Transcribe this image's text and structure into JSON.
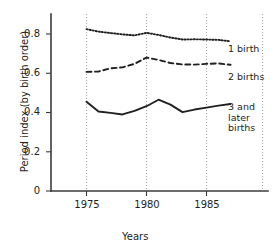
{
  "chart_data": {
    "type": "line",
    "title": "",
    "xlabel": "Years",
    "ylabel": "Period index (by birth order)",
    "xlim": [
      1973,
      1988
    ],
    "ylim": [
      0,
      0.9
    ],
    "xticks": [
      1975,
      1980,
      1985
    ],
    "xtick_labels": [
      "1975",
      "1980",
      "1985"
    ],
    "yticks": [
      0,
      0.2,
      0.4,
      0.6,
      0.8
    ],
    "ytick_labels": [
      "0",
      "0.2",
      "0.4",
      "0.6",
      "0.8"
    ],
    "grid": "vertical-dotted-at-xticks",
    "legend_position": "right-inline",
    "x": [
      1975,
      1976,
      1977,
      1978,
      1979,
      1980,
      1981,
      1982,
      1983,
      1984,
      1985,
      1986,
      1987
    ],
    "series": [
      {
        "name": "1 birth",
        "style": "dotted",
        "values": [
          0.825,
          0.812,
          0.805,
          0.798,
          0.793,
          0.806,
          0.795,
          0.782,
          0.772,
          0.773,
          0.772,
          0.77,
          0.763
        ]
      },
      {
        "name": "2 births",
        "style": "dashed",
        "values": [
          0.607,
          0.609,
          0.625,
          0.63,
          0.648,
          0.68,
          0.668,
          0.652,
          0.645,
          0.644,
          0.648,
          0.65,
          0.643
        ]
      },
      {
        "name": "3 and later births",
        "style": "solid",
        "values": [
          0.455,
          0.405,
          0.398,
          0.39,
          0.408,
          0.432,
          0.465,
          0.44,
          0.402,
          0.415,
          0.425,
          0.435,
          0.443
        ]
      }
    ]
  },
  "legend": {
    "items": [
      {
        "label": "1 birth",
        "lines": [
          "1 birth"
        ]
      },
      {
        "label": "2 births",
        "lines": [
          "2 births"
        ]
      },
      {
        "label": "3 and later births",
        "lines": [
          "3 and",
          "later",
          "births"
        ]
      }
    ]
  },
  "axes": {
    "x_title": "Years",
    "y_title": "Period index (by birth order)",
    "y_tick_0": "0",
    "y_tick_1": "0.2",
    "y_tick_2": "0.4",
    "y_tick_3": "0.6",
    "y_tick_4": "0.8",
    "x_tick_0": "1975",
    "x_tick_1": "1980",
    "x_tick_2": "1985"
  }
}
